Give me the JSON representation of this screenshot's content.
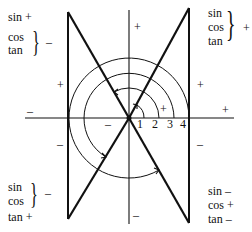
{
  "diagram": {
    "quadrants": {
      "top_left": {
        "lines": [
          "sin +",
          "cos",
          "tan"
        ],
        "brace_sign": "–"
      },
      "top_right": {
        "lines": [
          "sin",
          "cos",
          "tan"
        ],
        "brace_sign": "+"
      },
      "bottom_left": {
        "lines": [
          "sin",
          "cos",
          "tan +"
        ],
        "brace_sign": "–"
      },
      "bottom_right": {
        "lines": [
          "sin –",
          "cos +",
          "tan –"
        ]
      }
    },
    "axis_ticks": [
      "1",
      "2",
      "3",
      "4"
    ],
    "signs": {
      "y_axis_top": "+",
      "y_axis_bottom": "–",
      "x_axis_left": "–",
      "x_axis_right": "+",
      "left_line_upper_outer": "–",
      "left_line_upper_inner": "+",
      "left_line_lower_inner": "–",
      "left_line_lower_outer": "–",
      "right_line_upper": "+",
      "right_line_lower": "–",
      "inner_plus": "+",
      "inner_minus": "–"
    }
  }
}
